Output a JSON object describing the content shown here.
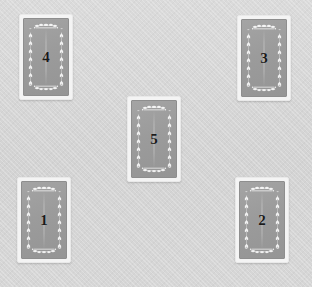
{
  "scene": {
    "name": "card-spread",
    "width": 312,
    "height": 287,
    "background_color": "#d6d6d6",
    "card_back_color": "#9b9b9b",
    "card_border_color": "#f4f4f4",
    "number_color": "#1a1a1a",
    "ornament_color": "#ffffff"
  },
  "cards": [
    {
      "id": "card-4",
      "label": "4",
      "face_up": false,
      "x": 19,
      "y": 14,
      "width": 54,
      "height": 86
    },
    {
      "id": "card-3",
      "label": "3",
      "face_up": false,
      "x": 237,
      "y": 15,
      "width": 54,
      "height": 86
    },
    {
      "id": "card-5",
      "label": "5",
      "face_up": false,
      "x": 127,
      "y": 96,
      "width": 54,
      "height": 86
    },
    {
      "id": "card-1",
      "label": "1",
      "face_up": false,
      "x": 17,
      "y": 177,
      "width": 54,
      "height": 86
    },
    {
      "id": "card-2",
      "label": "2",
      "face_up": false,
      "x": 235,
      "y": 177,
      "width": 54,
      "height": 86
    }
  ]
}
